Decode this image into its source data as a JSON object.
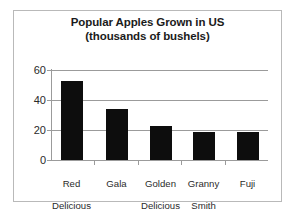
{
  "chart_data": {
    "type": "bar",
    "title": "Popular Apples Grown in US",
    "subtitle": "(thousands of bushels)",
    "title_full": "Popular Apples Grown in US (thousands of bushels)",
    "categories": [
      "Red Delicious",
      "Gala",
      "Golden Delicious",
      "Granny Smith",
      "Fuji"
    ],
    "category_lines": [
      [
        "Red",
        "Delicious"
      ],
      [
        "Gala",
        ""
      ],
      [
        "Golden",
        "Delicious"
      ],
      [
        "Granny",
        "Smith"
      ],
      [
        "Fuji",
        ""
      ]
    ],
    "values": [
      53,
      34,
      23,
      19,
      18.5
    ],
    "xlabel": "",
    "ylabel": "",
    "ylim": [
      0,
      60
    ],
    "yticks": [
      0,
      20,
      40,
      60
    ],
    "ytick_labels": [
      "0",
      "20",
      "40",
      "60"
    ],
    "grid": true,
    "grid_axis": "y",
    "legend": false,
    "bar_color": "#0d0d0d",
    "gridline_color": "#9b9b9b",
    "axis_color": "#9b9b9b",
    "frame_color": "#b9b9b9",
    "background_color": "#ffffff",
    "title_color": "#1b1b1b",
    "tick_label_color": "#2a2a2a"
  },
  "axis": {
    "y_tick_0": "0",
    "y_tick_1": "20",
    "y_tick_2": "40",
    "y_tick_3": "60"
  },
  "categories_text": {
    "c0_l1": "Red",
    "c0_l2": "Delicious",
    "c1_l1": "Gala",
    "c1_l2": "",
    "c2_l1": "Golden",
    "c2_l2": "Delicious",
    "c3_l1": "Granny",
    "c3_l2": "Smith",
    "c4_l1": "Fuji",
    "c4_l2": ""
  }
}
